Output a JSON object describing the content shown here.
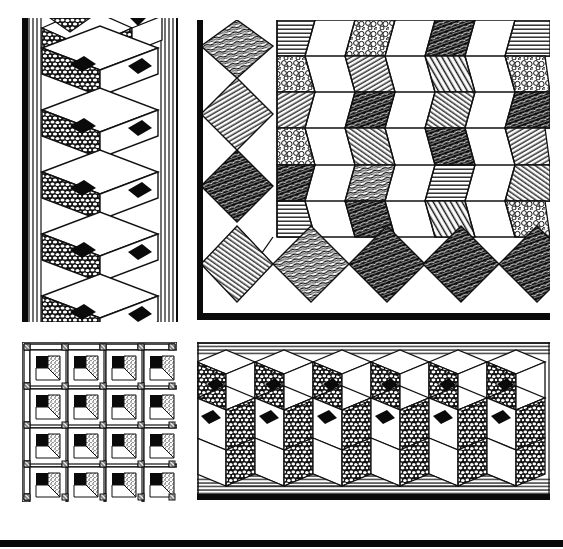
{
  "figure": {
    "caption": "",
    "background": "#ffffff",
    "ink": "#0a0a0a"
  },
  "panels": [
    {
      "id": "tall-left",
      "description": "Vertical strip of 3D cube pattern with pebbled faces, black squares, and hatched sides",
      "bbox": [
        20,
        20,
        160,
        300
      ]
    },
    {
      "id": "large-right",
      "description": "Corner border with hatched diamonds along the left and bottom, and herringbone/chevron field of textured parallelograms",
      "bbox": [
        197,
        20,
        353,
        300
      ]
    },
    {
      "id": "small-grid",
      "description": "4x4 grid of square tiles each with black, stippled, and white sections and hatched corner squares",
      "bbox": [
        22,
        342,
        155,
        160
      ]
    },
    {
      "id": "wide-band",
      "description": "Horizontal band of tumbling-block cubes with pebbled faces and black diamond centers, hatched top and bottom triangles",
      "bbox": [
        197,
        342,
        353,
        160
      ]
    }
  ],
  "rules": [
    {
      "id": "bottom-rule",
      "y": 540,
      "height": 7
    }
  ]
}
